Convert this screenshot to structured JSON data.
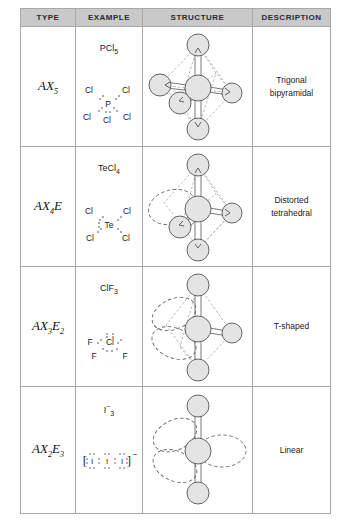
{
  "table": {
    "headers": [
      {
        "key": "type",
        "label": "TYPE"
      },
      {
        "key": "example",
        "label": "EXAMPLE"
      },
      {
        "key": "structure",
        "label": "STRUCTURE"
      },
      {
        "key": "description",
        "label": "DESCRIPTION"
      }
    ],
    "rows": [
      {
        "type_main": "AX",
        "type_sub": "5",
        "type_sub2": "",
        "type_full": "AX5",
        "formula_main": "PCl",
        "formula_sub": "5",
        "formula_sup": "",
        "formula_full": "PCl5",
        "lewis": {
          "center": "P",
          "ligands": [
            "Cl",
            "Cl",
            "Cl",
            "Cl",
            "Cl"
          ],
          "lone_pairs": 0,
          "charge": "",
          "brackets": false
        },
        "structure": {
          "geometry": "trigonal-bipyramidal",
          "axial_atoms": 2,
          "equatorial_atoms": 3,
          "lone_pair_lobes": 0
        },
        "description": "Trigonal\nbipyramidal",
        "description_line1": "Trigonal",
        "description_line2": "bipyramidal"
      },
      {
        "type_main": "AX",
        "type_sub": "4",
        "type_sub2": "E",
        "type_full": "AX4E",
        "formula_main": "TeCl",
        "formula_sub": "4",
        "formula_sup": "",
        "formula_full": "TeCl4",
        "lewis": {
          "center": "Te",
          "ligands": [
            "Cl",
            "Cl",
            "Cl",
            "Cl"
          ],
          "lone_pairs": 1,
          "charge": "",
          "brackets": false
        },
        "structure": {
          "geometry": "seesaw",
          "axial_atoms": 2,
          "equatorial_atoms": 2,
          "lone_pair_lobes": 1
        },
        "description": "Distorted\ntetrahedral",
        "description_line1": "Distorted",
        "description_line2": "tetrahedral"
      },
      {
        "type_main": "AX",
        "type_sub": "3",
        "type_sub2": "E",
        "type_sub3": "2",
        "type_full": "AX3E2",
        "formula_main": "ClF",
        "formula_sub": "3",
        "formula_sup": "",
        "formula_full": "ClF3",
        "lewis": {
          "center": "Cl",
          "ligands": [
            "F",
            "F",
            "F"
          ],
          "lone_pairs": 2,
          "charge": "",
          "brackets": false
        },
        "structure": {
          "geometry": "t-shaped",
          "axial_atoms": 2,
          "equatorial_atoms": 1,
          "lone_pair_lobes": 2
        },
        "description": "T-shaped",
        "description_line1": "T-shaped",
        "description_line2": ""
      },
      {
        "type_main": "AX",
        "type_sub": "2",
        "type_sub2": "E",
        "type_sub3": "3",
        "type_full": "AX2E3",
        "formula_main": "I",
        "formula_sub": "3",
        "formula_sup": "−",
        "formula_full": "I3−",
        "lewis": {
          "center": "I",
          "ligands": [
            "I",
            "I"
          ],
          "lone_pairs": 3,
          "charge": "−",
          "brackets": true
        },
        "structure": {
          "geometry": "linear",
          "axial_atoms": 2,
          "equatorial_atoms": 0,
          "lone_pair_lobes": 3
        },
        "description": "Linear",
        "description_line1": "Linear",
        "description_line2": ""
      }
    ]
  },
  "colors": {
    "header_bg": "#c9c9c9",
    "border": "#a8a8a8",
    "atom_fill": "#e2e2e2",
    "atom_stroke": "#555555",
    "lone_pair_stroke": "#555555",
    "text": "#222222"
  }
}
